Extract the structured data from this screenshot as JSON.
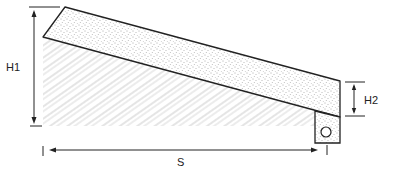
{
  "diagram": {
    "type": "cross-section",
    "labels": {
      "h1": "H1",
      "h2": "H2",
      "s": "S"
    },
    "elements": [
      {
        "name": "stippled-slab",
        "description": "sloped stippled layer"
      },
      {
        "name": "hatched-ground",
        "description": "hatched earth below slab"
      },
      {
        "name": "drain-box",
        "description": "stippled box with pipe at low end"
      },
      {
        "name": "drain-pipe",
        "description": "circular pipe inside drain box"
      },
      {
        "name": "h1-dimension",
        "description": "vertical height at high end"
      },
      {
        "name": "h2-dimension",
        "description": "slab thickness at low end"
      },
      {
        "name": "s-dimension",
        "description": "horizontal span"
      }
    ],
    "colors": {
      "line": "#222222",
      "hatch": "#9a9a9a",
      "stipple": "#555555",
      "background": "#ffffff"
    }
  }
}
